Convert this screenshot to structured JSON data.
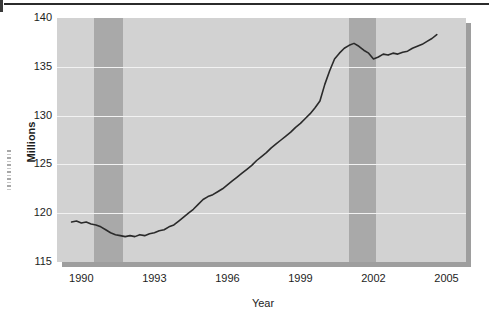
{
  "chart_data": {
    "type": "line",
    "title": "",
    "xlabel": "Year",
    "ylabel": "Millions",
    "xlim": [
      1989.0,
      2005.8
    ],
    "ylim": [
      115,
      140
    ],
    "grid": true,
    "legend": "none",
    "xticks": [
      "1990",
      "1993",
      "1996",
      "1999",
      "2002",
      "2005"
    ],
    "xtick_values": [
      1990,
      1993,
      1996,
      1999,
      2002,
      2005
    ],
    "yticks": [
      "115",
      "120",
      "125",
      "130",
      "135",
      "140"
    ],
    "ytick_values": [
      115,
      120,
      125,
      130,
      135,
      140
    ],
    "shaded_regions": [
      {
        "name": "recession-1990",
        "x_start": 1990.5,
        "x_end": 1991.7
      },
      {
        "name": "recession-2001",
        "x_start": 2001.0,
        "x_end": 2002.1
      }
    ],
    "series": [
      {
        "name": "Employment",
        "color": "#2a2a2a",
        "x": [
          1989.6,
          1989.8,
          1990.0,
          1990.2,
          1990.4,
          1990.6,
          1990.8,
          1991.0,
          1991.2,
          1991.4,
          1991.6,
          1991.8,
          1992.0,
          1992.2,
          1992.4,
          1992.6,
          1992.8,
          1993.0,
          1993.2,
          1993.4,
          1993.6,
          1993.8,
          1994.0,
          1994.2,
          1994.4,
          1994.6,
          1994.8,
          1995.0,
          1995.2,
          1995.4,
          1995.6,
          1995.8,
          1996.0,
          1996.2,
          1996.4,
          1996.6,
          1996.8,
          1997.0,
          1997.2,
          1997.4,
          1997.6,
          1997.8,
          1998.0,
          1998.2,
          1998.4,
          1998.6,
          1998.8,
          1999.0,
          1999.2,
          1999.4,
          1999.6,
          1999.8,
          2000.0,
          2000.2,
          2000.4,
          2000.6,
          2000.8,
          2001.0,
          2001.2,
          2001.4,
          2001.6,
          2001.8,
          2002.0,
          2002.2,
          2002.4,
          2002.6,
          2002.8,
          2003.0,
          2003.2,
          2003.4,
          2003.6,
          2003.8,
          2004.0,
          2004.2,
          2004.4,
          2004.6
        ],
        "y": [
          119.1,
          119.2,
          119.0,
          119.1,
          118.9,
          118.8,
          118.6,
          118.3,
          118.0,
          117.8,
          117.7,
          117.6,
          117.7,
          117.6,
          117.8,
          117.7,
          117.9,
          118.0,
          118.2,
          118.3,
          118.6,
          118.8,
          119.2,
          119.6,
          120.0,
          120.4,
          120.9,
          121.4,
          121.7,
          121.9,
          122.2,
          122.5,
          122.9,
          123.3,
          123.7,
          124.1,
          124.5,
          124.9,
          125.4,
          125.8,
          126.2,
          126.7,
          127.1,
          127.5,
          127.9,
          128.3,
          128.8,
          129.2,
          129.7,
          130.2,
          130.8,
          131.5,
          133.2,
          134.6,
          135.8,
          136.4,
          136.9,
          137.2,
          137.4,
          137.1,
          136.7,
          136.4,
          135.8,
          136.0,
          136.3,
          136.2,
          136.4,
          136.3,
          136.5,
          136.6,
          136.9,
          137.1,
          137.3,
          137.6,
          137.9,
          138.3
        ]
      }
    ]
  },
  "colors": {
    "plot_background": "#d2d2d2",
    "shaded_band": "#a9a9a9",
    "gridline": "#f2f2f2",
    "line": "#2a2a2a",
    "shadow": "#9e9e9e",
    "text": "#1d1d1d",
    "page_background": "#ffffff"
  }
}
